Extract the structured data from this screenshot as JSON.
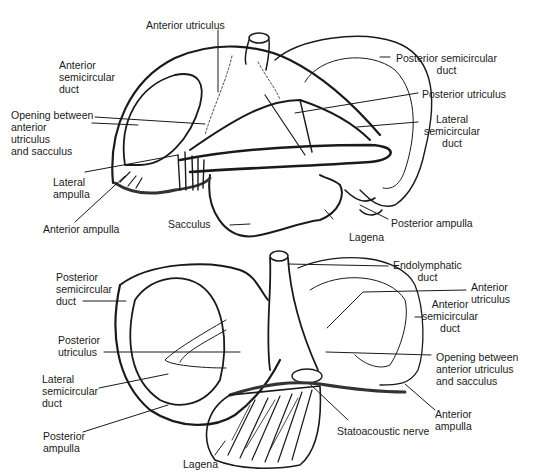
{
  "figure": {
    "views": [
      {
        "id": "top-view",
        "labels": {
          "anterior_utriculus": "Anterior utriculus",
          "anterior_semicircular_duct": [
            "Anterior",
            "semicircular",
            "duct"
          ],
          "opening": [
            "Opening between",
            "anterior",
            "utriculus",
            "and sacculus"
          ],
          "lateral_ampulla": [
            "Lateral",
            "ampulla"
          ],
          "anterior_ampulla": "Anterior ampulla",
          "sacculus": "Sacculus",
          "lagena": "Lagena",
          "posterior_semicircular_duct": [
            "Posterior semicircular",
            "duct"
          ],
          "posterior_utriculus": "Posterior utriculus",
          "lateral_semicircular_duct": [
            "Lateral",
            "semicircular",
            "duct"
          ],
          "posterior_ampulla": "Posterior ampulla"
        }
      },
      {
        "id": "bottom-view",
        "labels": {
          "posterior_semicircular_duct": [
            "Posterior",
            "semicircular",
            "duct"
          ],
          "posterior_utriculus": [
            "Posterior",
            "utriculus"
          ],
          "lateral_semicircular_duct": [
            "Lateral",
            "semicircular",
            "duct"
          ],
          "posterior_ampulla": [
            "Posterior",
            "ampulla"
          ],
          "lagena": "Lagena",
          "endolymphatic_duct": [
            "Endolymphatic",
            "duct"
          ],
          "anterior_utriculus": [
            "Anterior",
            "utriculus"
          ],
          "anterior_semicircular_duct": [
            "Anterior",
            "semicircular",
            "duct"
          ],
          "opening": [
            "Opening between",
            "anterior utriculus",
            "and sacculus"
          ],
          "statoacoustic_nerve": "Statoacoustic nerve",
          "anterior_ampulla": [
            "Anterior",
            "ampulla"
          ]
        }
      }
    ],
    "colors": {
      "ink": "#1a1a1a",
      "background": "#ffffff"
    }
  }
}
